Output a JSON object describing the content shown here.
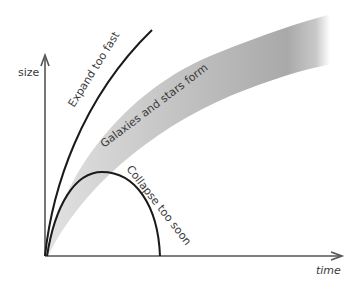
{
  "diagram": {
    "type": "universe-expansion-scenarios",
    "axes": {
      "y_label": "size",
      "x_label": "time"
    },
    "curves": [
      {
        "id": "expand",
        "label": "Expand too fast",
        "style": "line",
        "color": "#1a1a1a"
      },
      {
        "id": "band",
        "label": "Galaxies and stars form",
        "style": "shaded-band",
        "color": "#b8b8b8"
      },
      {
        "id": "collapse",
        "label": "Collapse too soon",
        "style": "line",
        "color": "#1a1a1a"
      }
    ],
    "colors": {
      "axis": "#555555",
      "line": "#1a1a1a",
      "band_light": "#dcdcdc",
      "band_dark": "#a8a8a8",
      "text": "#3a3a3a"
    }
  }
}
